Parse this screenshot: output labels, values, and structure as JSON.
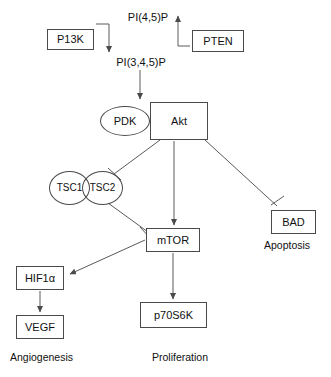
{
  "diagram": {
    "nodes": [
      {
        "id": "pi45p",
        "label": "PI(4,5)P",
        "shape": "plain",
        "x": 117,
        "y": 10,
        "w": 62,
        "h": 14
      },
      {
        "id": "pi3k",
        "label": "P13K",
        "shape": "box",
        "x": 47,
        "y": 29,
        "w": 47,
        "h": 21
      },
      {
        "id": "pten",
        "label": "PTEN",
        "shape": "box",
        "x": 192,
        "y": 30,
        "w": 52,
        "h": 22
      },
      {
        "id": "pi345p",
        "label": "PI(3,4,5)P",
        "shape": "plain",
        "x": 104,
        "y": 55,
        "w": 74,
        "h": 14
      },
      {
        "id": "pdk",
        "label": "PDK",
        "shape": "ellipse",
        "x": 100,
        "y": 106,
        "w": 50,
        "h": 30
      },
      {
        "id": "akt",
        "label": "Akt",
        "shape": "box",
        "x": 150,
        "y": 102,
        "w": 58,
        "h": 38
      },
      {
        "id": "tsc1",
        "label": "TSC1",
        "shape": "ellipse",
        "x": 49,
        "y": 171,
        "w": 41,
        "h": 34
      },
      {
        "id": "tsc2",
        "label": "TSC2",
        "shape": "ellipse",
        "x": 82,
        "y": 171,
        "w": 41,
        "h": 34
      },
      {
        "id": "mtor",
        "label": "mTOR",
        "shape": "box",
        "x": 146,
        "y": 228,
        "w": 54,
        "h": 24
      },
      {
        "id": "bad",
        "label": "BAD",
        "shape": "box",
        "x": 271,
        "y": 210,
        "w": 45,
        "h": 24
      },
      {
        "id": "hif1a",
        "label": "HIF1α",
        "shape": "box",
        "x": 16,
        "y": 266,
        "w": 48,
        "h": 24
      },
      {
        "id": "vegf",
        "label": "VEGF",
        "shape": "box",
        "x": 16,
        "y": 315,
        "w": 48,
        "h": 24
      },
      {
        "id": "p70s6k",
        "label": "p70S6K",
        "shape": "box",
        "x": 140,
        "y": 302,
        "w": 67,
        "h": 26
      }
    ],
    "captions": [
      {
        "id": "apoptosis",
        "label": "Apoptosis",
        "x": 264,
        "y": 240
      },
      {
        "id": "angiogenesis",
        "label": "Angiogenesis",
        "x": 10,
        "y": 352
      },
      {
        "id": "proliferation",
        "label": "Proliferation",
        "x": 152,
        "y": 352
      }
    ],
    "edges": [
      {
        "id": "pi3k-to-pi345p",
        "from": "pi3k",
        "to": "pi345p",
        "type": "activation"
      },
      {
        "id": "pten-to-pi45p",
        "from": "pten",
        "to": "pi45p",
        "type": "activation"
      },
      {
        "id": "pi345p-to-akt",
        "from": "pi345p",
        "to": "akt",
        "type": "activation"
      },
      {
        "id": "akt-to-tsc",
        "from": "akt",
        "to": "tsc1",
        "type": "inhibition"
      },
      {
        "id": "akt-to-mtor",
        "from": "akt",
        "to": "mtor",
        "type": "activation"
      },
      {
        "id": "akt-to-bad",
        "from": "akt",
        "to": "bad",
        "type": "inhibition"
      },
      {
        "id": "tsc-to-mtor",
        "from": "tsc2",
        "to": "mtor",
        "type": "inhibition"
      },
      {
        "id": "mtor-to-hif1a",
        "from": "mtor",
        "to": "hif1a",
        "type": "activation"
      },
      {
        "id": "mtor-to-p70s6k",
        "from": "mtor",
        "to": "p70s6k",
        "type": "activation"
      },
      {
        "id": "hif1a-to-vegf",
        "from": "hif1a",
        "to": "vegf",
        "type": "activation"
      }
    ],
    "colors": {
      "stroke": "#4a4a4a",
      "edge": "#5a5a5a",
      "text": "#111111",
      "background": "#ffffff"
    }
  }
}
